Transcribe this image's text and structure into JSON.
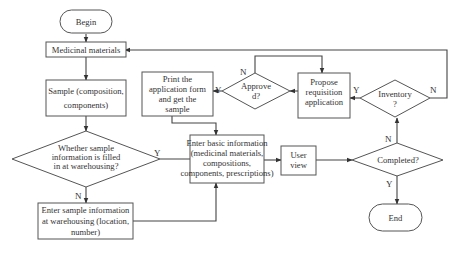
{
  "diagram": {
    "type": "flowchart",
    "colors": {
      "stroke": "#555555",
      "text": "#333333",
      "background": "#ffffff"
    },
    "nodes": {
      "begin": {
        "shape": "terminator",
        "lines": [
          "Begin"
        ]
      },
      "medicinal_materials": {
        "shape": "process",
        "lines": [
          "Medicinal materials"
        ]
      },
      "sample": {
        "shape": "process",
        "lines": [
          "Sample (composition,",
          "components)"
        ]
      },
      "whether_filled": {
        "shape": "decision",
        "lines": [
          "Whether sample",
          "information is filled",
          "in at warehousing?"
        ]
      },
      "enter_sample_info": {
        "shape": "process",
        "lines": [
          "Enter sample information",
          "at warehousing (location,",
          "number)"
        ]
      },
      "print_form": {
        "shape": "process",
        "lines": [
          "Print the",
          "application form",
          "and get the",
          "sample"
        ]
      },
      "approved": {
        "shape": "decision",
        "lines": [
          "Approve",
          "d?"
        ]
      },
      "propose": {
        "shape": "process",
        "lines": [
          "Propose",
          "requisition",
          "application"
        ]
      },
      "enter_basic_info": {
        "shape": "process",
        "lines": [
          "Enter basic information",
          "(medicinal materials,",
          "compositions,",
          "components, prescriptions)"
        ]
      },
      "user_view": {
        "shape": "process",
        "lines": [
          "User",
          "view"
        ]
      },
      "completed": {
        "shape": "decision",
        "lines": [
          "Completed?"
        ]
      },
      "inventory": {
        "shape": "decision",
        "lines": [
          "Inventory",
          "?"
        ]
      },
      "end": {
        "shape": "terminator",
        "lines": [
          "End"
        ]
      }
    },
    "edge_labels": {
      "whether_yes": "Y",
      "whether_no": "N",
      "approved_yes": "Y",
      "approved_no": "N",
      "inventory_yes": "Y",
      "inventory_no": "N",
      "completed_no": "N",
      "completed_yes": "Y"
    },
    "edges": [
      {
        "from": "begin",
        "to": "medicinal_materials"
      },
      {
        "from": "medicinal_materials",
        "to": "sample"
      },
      {
        "from": "sample",
        "to": "whether_filled"
      },
      {
        "from": "whether_filled",
        "to": "enter_basic_info",
        "label": "Y"
      },
      {
        "from": "whether_filled",
        "to": "enter_sample_info",
        "label": "N"
      },
      {
        "from": "enter_sample_info",
        "to": "enter_basic_info"
      },
      {
        "from": "enter_basic_info",
        "to": "user_view"
      },
      {
        "from": "user_view",
        "to": "completed"
      },
      {
        "from": "completed",
        "to": "end",
        "label": "Y"
      },
      {
        "from": "completed",
        "to": "inventory",
        "label": "N"
      },
      {
        "from": "inventory",
        "to": "propose",
        "label": "Y"
      },
      {
        "from": "inventory",
        "to": "medicinal_materials",
        "label": "N"
      },
      {
        "from": "propose",
        "to": "approved"
      },
      {
        "from": "approved",
        "to": "print_form",
        "label": "Y"
      },
      {
        "from": "approved",
        "to": "propose",
        "label": "N"
      },
      {
        "from": "print_form",
        "to": "enter_basic_info"
      }
    ]
  }
}
